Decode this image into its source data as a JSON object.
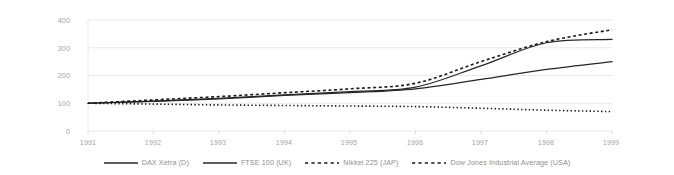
{
  "chart_data": {
    "type": "line",
    "title": "",
    "xlabel": "",
    "ylabel": "",
    "x": [
      1991,
      1992,
      1993,
      1994,
      1995,
      1996,
      1997,
      1998,
      1999
    ],
    "categories": [
      "1991",
      "1992",
      "1993",
      "1994",
      "1995",
      "1996",
      "1997",
      "1998",
      "1999"
    ],
    "xlim": [
      1991,
      1999
    ],
    "ylim": [
      0,
      400
    ],
    "y_ticks": [
      0,
      100,
      200,
      300,
      400
    ],
    "x_ticks": [
      "1991",
      "1992",
      "1993",
      "1994",
      "1995",
      "1996",
      "1997",
      "1998",
      "1999"
    ],
    "grid": "horizontal",
    "legend_position": "bottom",
    "series": [
      {
        "name": "DAX Xetra (D)",
        "style": "solid",
        "color": "#262626",
        "values": [
          100,
          108,
          118,
          130,
          142,
          158,
          235,
          318,
          330
        ]
      },
      {
        "name": "FTSE 100 (UK)",
        "style": "solid",
        "color": "#262626",
        "values": [
          100,
          107,
          116,
          128,
          138,
          152,
          186,
          222,
          250
        ]
      },
      {
        "name": "Nikkei 225 (JAP)",
        "style": "dashed",
        "color": "#1a1a1a",
        "values": [
          100,
          112,
          124,
          138,
          152,
          172,
          250,
          322,
          365
        ]
      },
      {
        "name": "Dow Jones Industrial Average (USA)",
        "style": "dotted",
        "color": "#1a1a1a",
        "values": [
          100,
          97,
          94,
          92,
          90,
          88,
          82,
          75,
          70
        ]
      }
    ]
  },
  "axis": {
    "y_labels": [
      "400",
      "300",
      "200",
      "100",
      "0"
    ],
    "x_labels": [
      "1991",
      "1992",
      "1993",
      "1994",
      "1995",
      "1996",
      "1997",
      "1998",
      "1999"
    ]
  },
  "legend": {
    "items": [
      {
        "label": "DAX Xetra (D)",
        "style": "solid"
      },
      {
        "label": "FTSE 100 (UK)",
        "style": "solid"
      },
      {
        "label": "Nikkei 225 (JAP)",
        "style": "dashed"
      },
      {
        "label": "Dow Jones Industrial Average (USA)",
        "style": "dotted"
      }
    ]
  },
  "colors": {
    "grid": "#e8e8e8",
    "axis_text": "#a6a6a6",
    "legend_text": "#8f8f8f",
    "line": "#262626",
    "background": "#ffffff"
  }
}
